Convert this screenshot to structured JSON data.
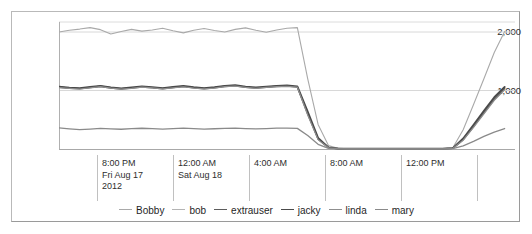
{
  "chart_data": {
    "type": "line",
    "title": "",
    "xlabel": "",
    "ylabel": "",
    "grid": true,
    "legend_position": "bottom",
    "ylim": [
      0,
      2100
    ],
    "yticks": [
      1000,
      2000
    ],
    "ytick_labels": [
      "1,000",
      "2,000"
    ],
    "xtick_labels": [
      [
        "8:00 PM",
        "Fri Aug 17",
        "2012"
      ],
      [
        "12:00 AM",
        "Sat Aug 18"
      ],
      [
        "4:00 AM"
      ],
      [
        "8:00 AM"
      ],
      [
        "12:00 PM"
      ]
    ],
    "x": [
      0,
      1,
      2,
      3,
      4,
      5,
      6,
      7,
      8,
      9,
      10,
      11,
      12,
      13,
      14,
      15,
      16,
      17,
      18,
      19,
      20,
      21,
      22,
      23,
      24,
      25,
      26,
      27,
      28,
      29,
      30,
      31,
      32,
      33,
      34,
      35,
      36,
      37,
      38,
      39,
      40,
      41,
      42,
      43,
      44
    ],
    "series": [
      {
        "name": "Bobby",
        "color": "#a9a9a9",
        "width": 1.1,
        "values": [
          2000,
          2030,
          2050,
          2075,
          2040,
          1965,
          2010,
          2045,
          2015,
          2035,
          2065,
          2020,
          1985,
          2030,
          2060,
          2025,
          2000,
          2045,
          2070,
          2030,
          1995,
          2035,
          2065,
          2075,
          1200,
          420,
          60,
          10,
          5,
          5,
          5,
          5,
          5,
          5,
          5,
          5,
          5,
          5,
          20,
          330,
          760,
          1200,
          1650,
          2010,
          null
        ]
      },
      {
        "name": "bob",
        "color": "#b4b4b4",
        "width": 1.1,
        "values": [
          1060,
          1045,
          1035,
          1055,
          1075,
          1050,
          1030,
          1045,
          1065,
          1050,
          1035,
          1055,
          1070,
          1050,
          1035,
          1050,
          1075,
          1085,
          1060,
          1045,
          1060,
          1075,
          1080,
          1065,
          620,
          180,
          25,
          6,
          4,
          4,
          4,
          4,
          4,
          4,
          4,
          4,
          4,
          4,
          14,
          170,
          400,
          640,
          870,
          1050,
          null
        ]
      },
      {
        "name": "extrauser",
        "color": "#5c5c5c",
        "width": 1.6,
        "values": [
          1055,
          1040,
          1030,
          1050,
          1070,
          1045,
          1028,
          1042,
          1060,
          1048,
          1032,
          1050,
          1068,
          1046,
          1032,
          1046,
          1070,
          1080,
          1056,
          1042,
          1056,
          1070,
          1076,
          1060,
          600,
          170,
          22,
          5,
          3,
          3,
          3,
          3,
          3,
          3,
          3,
          3,
          3,
          3,
          12,
          160,
          385,
          620,
          850,
          1030,
          null
        ]
      },
      {
        "name": "jacky",
        "color": "#4a4a4a",
        "width": 1.8,
        "values": [
          1065,
          1050,
          1040,
          1060,
          1080,
          1055,
          1038,
          1052,
          1070,
          1058,
          1042,
          1060,
          1078,
          1056,
          1042,
          1056,
          1080,
          1090,
          1066,
          1052,
          1066,
          1080,
          1086,
          1070,
          640,
          190,
          28,
          7,
          5,
          5,
          5,
          5,
          5,
          5,
          5,
          5,
          5,
          5,
          16,
          180,
          415,
          655,
          885,
          1060,
          null
        ]
      },
      {
        "name": "linda",
        "color": "#8f8f8f",
        "width": 1.2,
        "values": [
          1050,
          1038,
          1026,
          1046,
          1066,
          1042,
          1024,
          1038,
          1056,
          1044,
          1028,
          1046,
          1064,
          1042,
          1028,
          1042,
          1066,
          1076,
          1052,
          1038,
          1052,
          1066,
          1072,
          1056,
          580,
          160,
          20,
          5,
          3,
          3,
          3,
          3,
          3,
          3,
          3,
          3,
          3,
          3,
          11,
          150,
          370,
          600,
          830,
          1010,
          null
        ]
      },
      {
        "name": "mary",
        "color": "#8a8a8a",
        "width": 1.3,
        "values": [
          360,
          345,
          330,
          340,
          352,
          345,
          338,
          348,
          355,
          348,
          340,
          348,
          356,
          348,
          340,
          346,
          354,
          358,
          350,
          344,
          350,
          356,
          358,
          352,
          230,
          80,
          12,
          4,
          3,
          3,
          3,
          3,
          3,
          3,
          3,
          3,
          3,
          3,
          6,
          55,
          130,
          215,
          290,
          350,
          null
        ]
      }
    ]
  },
  "legend": {
    "items": [
      {
        "label": "Bobby"
      },
      {
        "label": "bob"
      },
      {
        "label": "extrauser"
      },
      {
        "label": "jacky"
      },
      {
        "label": "linda"
      },
      {
        "label": "mary"
      }
    ]
  }
}
